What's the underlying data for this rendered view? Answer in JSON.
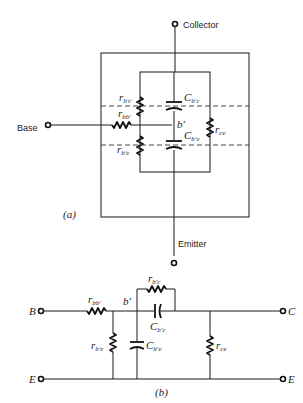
{
  "figure": {
    "part_a": {
      "caption": "(a)",
      "terminals": {
        "collector": "Collector",
        "base": "Base",
        "emitter": "Emitter"
      },
      "components": {
        "r_bc": {
          "sym": "r",
          "sub": "b′c"
        },
        "r_bb": {
          "sym": "r",
          "sub": "bb′"
        },
        "r_be": {
          "sym": "r",
          "sub": "b′e"
        },
        "c_bc": {
          "sym": "C",
          "sub": "b′c"
        },
        "c_be": {
          "sym": "C",
          "sub": "b′e"
        },
        "r_ce": {
          "sym": "r",
          "sub": "ce"
        },
        "node_b": "b′"
      }
    },
    "part_b": {
      "caption": "(b)",
      "terminals": {
        "B": "B",
        "C": "C",
        "E_left": "E",
        "E_right": "E"
      },
      "components": {
        "r_bb": {
          "sym": "r",
          "sub": "bb′"
        },
        "r_bc": {
          "sym": "r",
          "sub": "b′c"
        },
        "c_bc": {
          "sym": "C",
          "sub": "b′c"
        },
        "r_be": {
          "sym": "r",
          "sub": "b′e"
        },
        "c_be": {
          "sym": "C",
          "sub": "b′e"
        },
        "r_ce": {
          "sym": "r",
          "sub": "ce"
        },
        "node_b": "b′"
      }
    }
  }
}
